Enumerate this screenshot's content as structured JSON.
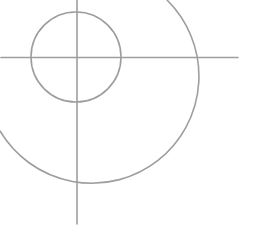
{
  "diagram": {
    "type": "crosshair-target",
    "stroke_color": "#9e9e9e",
    "stroke_width": 1.6,
    "center": {
      "x": 77,
      "y": 57
    },
    "vertical_line": {
      "x": 77,
      "y1": 0,
      "y2": 224
    },
    "horizontal_line": {
      "y": 57.5,
      "x1": 1,
      "x2": 238
    },
    "inner_circle": {
      "cx": 76,
      "cy": 57,
      "r": 45
    },
    "outer_arc": {
      "cx": 77,
      "cy": 57,
      "r": 107,
      "start": {
        "x": 167,
        "y": 0
      },
      "end": {
        "x": 0,
        "y": 131
      }
    }
  }
}
